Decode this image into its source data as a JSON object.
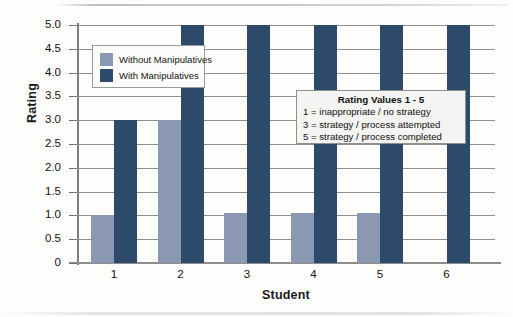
{
  "chart_data": {
    "type": "bar",
    "title": "",
    "xlabel": "Student",
    "ylabel": "Rating",
    "categories": [
      "1",
      "2",
      "3",
      "4",
      "5",
      "6"
    ],
    "series": [
      {
        "name": "Without Manipulatives",
        "color": "#8b98b2",
        "values": [
          1.0,
          3.0,
          1.05,
          1.05,
          1.05,
          0
        ]
      },
      {
        "name": "With Manipulatives",
        "color": "#2e4a6b",
        "values": [
          3.0,
          5.0,
          5.0,
          5.0,
          5.0,
          5.0
        ]
      }
    ],
    "ylim": [
      0,
      5.0
    ],
    "ytick_values": [
      0,
      0.5,
      1.0,
      1.5,
      2.0,
      2.5,
      3.0,
      3.5,
      4.0,
      4.5,
      5.0
    ],
    "ytick_labels": [
      "0",
      "0.5",
      "1.0",
      "1.5",
      "2.0",
      "2.5",
      "3.0",
      "3.5",
      "4.0",
      "4.5",
      "5.0"
    ],
    "grid": true,
    "legend_position": "upper-left-inside"
  },
  "legend": {
    "items": [
      {
        "label": "Without Manipulatives",
        "color": "#8b98b2"
      },
      {
        "label": "With Manipulatives",
        "color": "#2e4a6b"
      }
    ]
  },
  "keybox": {
    "title": "Rating Values 1 - 5",
    "lines": [
      "1 = inappropriate / no strategy",
      "3 = strategy / process attempted",
      "5 = strategy / process completed"
    ]
  }
}
